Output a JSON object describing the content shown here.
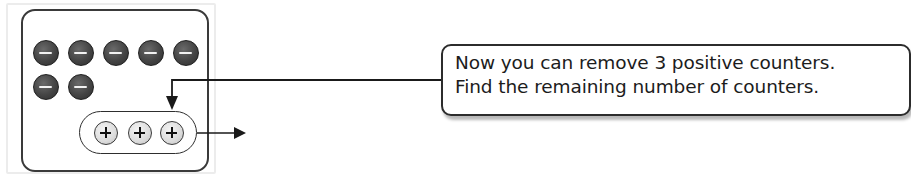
{
  "diagram": {
    "mat": {
      "negative_counters": [
        {
          "sign": "minus",
          "color": "#3f3f3f"
        },
        {
          "sign": "minus",
          "color": "#3f3f3f"
        },
        {
          "sign": "minus",
          "color": "#3f3f3f"
        },
        {
          "sign": "minus",
          "color": "#3f3f3f"
        },
        {
          "sign": "minus",
          "color": "#3f3f3f"
        },
        {
          "sign": "minus",
          "color": "#3f3f3f"
        },
        {
          "sign": "minus",
          "color": "#3f3f3f"
        }
      ],
      "negative_count": 7,
      "positive_counters": [
        {
          "sign": "plus",
          "color": "#dcdcdc"
        },
        {
          "sign": "plus",
          "color": "#dcdcdc"
        },
        {
          "sign": "plus",
          "color": "#dcdcdc"
        }
      ],
      "positive_count": 3
    },
    "callout": {
      "lines": [
        "Now you can remove 3 positive counters.",
        "Find the remaining number of counters."
      ]
    },
    "arrows": [
      {
        "from": "callout",
        "to": "positive-counters-group",
        "direction": "down"
      },
      {
        "from": "positive-counters-group",
        "to": "outside-mat",
        "direction": "right"
      }
    ]
  }
}
